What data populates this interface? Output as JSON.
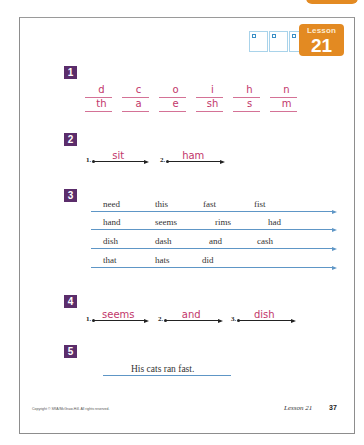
{
  "header": {
    "lesson_label": "Lesson",
    "lesson_number": "21",
    "score_boxes": 3,
    "colors": {
      "accent_orange": "#e38a22",
      "section_purple": "#5b2d6b",
      "handwriting_pink": "#c2366a",
      "line_blue": "#5e96c6"
    }
  },
  "sections": [
    {
      "number": "1",
      "rows": [
        [
          "d",
          "c",
          "o",
          "i",
          "h",
          "n"
        ],
        [
          "th",
          "a",
          "e",
          "sh",
          "s",
          "m"
        ]
      ]
    },
    {
      "number": "2",
      "items": [
        {
          "n": "1.",
          "answer": "sit"
        },
        {
          "n": "2.",
          "answer": "ham"
        }
      ]
    },
    {
      "number": "3",
      "rows": [
        [
          "need",
          "this",
          "fast",
          "fist"
        ],
        [
          "hand",
          "seems",
          "rims",
          "had"
        ],
        [
          "dish",
          "dash",
          "and",
          "cash"
        ],
        [
          "that",
          "hats",
          "did"
        ]
      ]
    },
    {
      "number": "4",
      "items": [
        {
          "n": "1.",
          "answer": "seems"
        },
        {
          "n": "2.",
          "answer": "and"
        },
        {
          "n": "3.",
          "answer": "dish"
        }
      ]
    },
    {
      "number": "5",
      "sentence": "His cats ran fast."
    }
  ],
  "footer": {
    "copyright": "Copyright © SRA/McGraw-Hill. All rights reserved.",
    "lesson": "Lesson 21",
    "page": "37"
  }
}
